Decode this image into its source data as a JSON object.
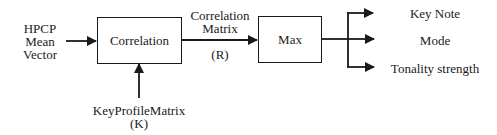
{
  "diagram": {
    "inputs": {
      "hpcp": {
        "lines": [
          "HPCP",
          "Mean",
          "Vector"
        ]
      },
      "key_profile": {
        "lines": [
          "KeyProfileMatrix",
          "(K)"
        ]
      }
    },
    "blocks": {
      "correlation": {
        "label": "Correlation"
      },
      "max": {
        "label": "Max"
      }
    },
    "edges": {
      "correlation_to_max": {
        "lines": [
          "Correlation",
          "Matrix"
        ],
        "symbol": "(R)"
      }
    },
    "outputs": [
      {
        "label": "Key Note"
      },
      {
        "label": "Mode"
      },
      {
        "label": "Tonality strength"
      }
    ],
    "colors": {
      "stroke": "#1a1a1a",
      "background": "#ffffff"
    }
  }
}
